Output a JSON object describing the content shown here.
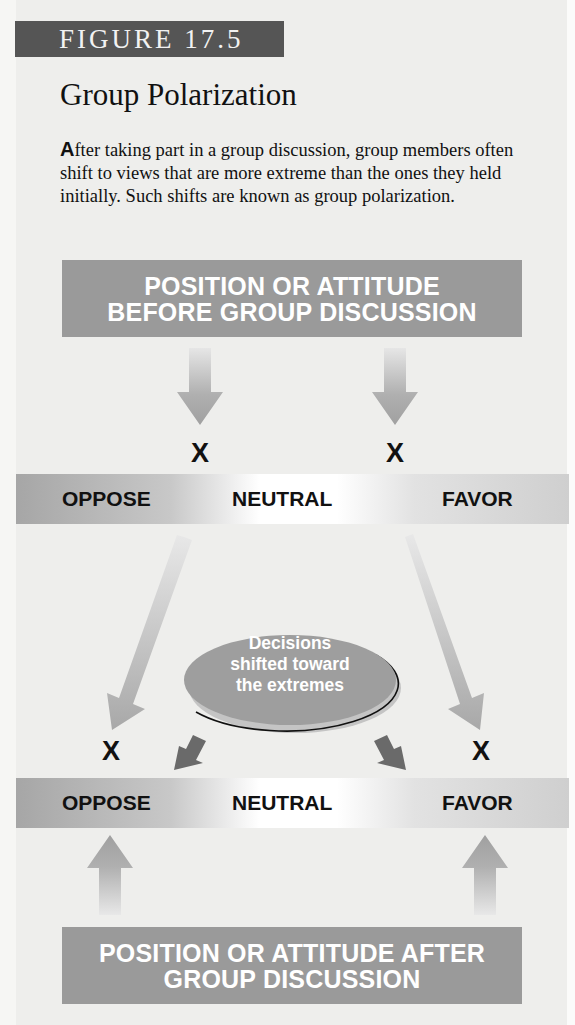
{
  "figure": {
    "label": "FIGURE 17.5",
    "title": "Group Polarization",
    "description_dropcap": "A",
    "description_rest": "fter taking part in a group discussion, group members often shift to views that are more extreme than the ones they held initially. Such shifts are known as group polarization."
  },
  "diagram": {
    "top_box": {
      "line1": "POSITION OR ATTITUDE",
      "line2": "BEFORE GROUP DISCUSSION"
    },
    "scale_before": {
      "left": "OPPOSE",
      "center": "NEUTRAL",
      "right": "FAVOR"
    },
    "markers_before": [
      "X",
      "X"
    ],
    "ellipse": {
      "line1": "Decisions",
      "line2": "shifted toward",
      "line3": "the extremes"
    },
    "markers_after": [
      "X",
      "X"
    ],
    "scale_after": {
      "left": "OPPOSE",
      "center": "NEUTRAL",
      "right": "FAVOR"
    },
    "bottom_box": {
      "line1": "POSITION OR ATTITUDE AFTER",
      "line2": "GROUP DISCUSSION"
    }
  },
  "colors": {
    "badge": "#555555",
    "box": "#9a9a9a",
    "arrow": "#a8a8a8",
    "dark_arrow": "#666666",
    "ellipse": "#9e9e9e",
    "background": "#eeeeec"
  }
}
